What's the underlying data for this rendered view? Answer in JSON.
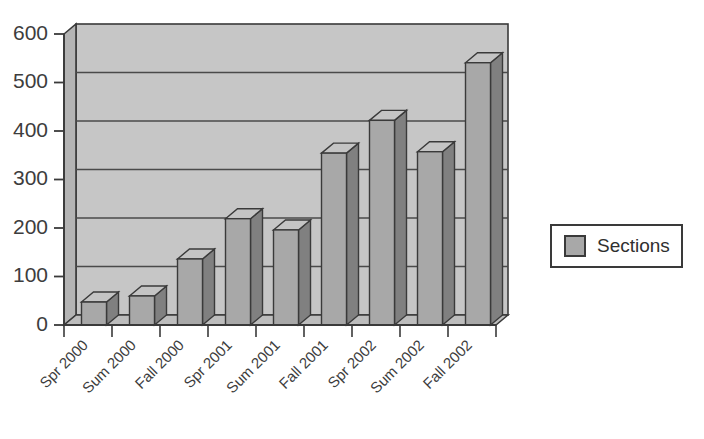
{
  "chart_data": {
    "type": "bar",
    "title": "",
    "xlabel": "",
    "ylabel": "",
    "categories": [
      "Spr 2000",
      "Sum 2000",
      "Fall 2000",
      "Spr 2001",
      "Sum 2001",
      "Fall 2001",
      "Spr 2002",
      "Sum 2002",
      "Fall 2002"
    ],
    "series": [
      {
        "name": "Sections",
        "values": [
          49,
          62,
          141,
          227,
          203,
          367,
          437,
          370,
          560
        ]
      }
    ],
    "ylim": [
      0,
      600
    ],
    "yticks": [
      0,
      100,
      200,
      300,
      400,
      500,
      600
    ],
    "ytick_labels": [
      "0",
      "100",
      "200",
      "300",
      "400",
      "500",
      "600"
    ],
    "grid": "horizontal",
    "legend_position": "right",
    "style": "3d-column",
    "colors": {
      "bar_front": "#a8a8a8",
      "bar_top": "#c4c4c4",
      "bar_side": "#808080",
      "plot_background": "#c6c6c6",
      "wall_side": "#b4b4b4",
      "axis": "#3a3a3a",
      "gridline": "#4a4a4a",
      "page_background": "#ffffff",
      "legend_border": "#3a3a3a",
      "legend_background": "#ffffff"
    }
  },
  "legend": {
    "entries": [
      {
        "label": "Sections",
        "swatch_color": "#a8a8a8"
      }
    ]
  },
  "axes": {
    "y": {
      "labels": [
        "600",
        "500",
        "400",
        "300",
        "200",
        "100",
        "0"
      ]
    },
    "x": {
      "labels": [
        "Spr 2000",
        "Sum 2000",
        "Fall 2000",
        "Spr 2001",
        "Sum 2001",
        "Fall 2001",
        "Spr 2002",
        "Sum 2002",
        "Fall 2002"
      ]
    }
  }
}
